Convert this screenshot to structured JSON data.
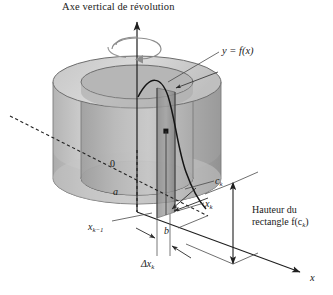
{
  "figure": {
    "domain": "mathematical-diagram",
    "topic": "Méthode des coquilles cylindriques (shell method)",
    "width": 333,
    "height": 295,
    "background": "#ffffff"
  },
  "labels": {
    "title": "Axe vertical de révolution",
    "curve": "y = f(x)",
    "origin": "0",
    "lower_bound": "a",
    "upper_bound": "b",
    "midpoint": "c",
    "midpoint_sub": "k",
    "x_right": "x",
    "x_right_sub": "k",
    "x_left": "x",
    "x_left_sub": "k−1",
    "delta": "Δx",
    "delta_sub": "k",
    "height_line1": "Hauteur du",
    "height_line2": "rectangle",
    "height_value": "f(c",
    "height_value_sub": "k",
    "height_value_end": ")",
    "x_axis": "x"
  },
  "colors": {
    "ink": "#1a1a1a",
    "outline": "#3a3a3a",
    "cylinder_light": "#d8d8d8",
    "cylinder_mid": "#c2c2c2",
    "cylinder_dark": "#a8a8a8",
    "cylinder_darker": "#8f8f8f",
    "shell_face": "#9a9a9a",
    "shell_face_dark": "#7d7d7d",
    "top_annulus": "#cfcfcf",
    "inner_bore": "#bdbdbd",
    "leader": "#555555",
    "background": "#ffffff"
  },
  "geometry": {
    "axis_x": 137,
    "cyl_top_cy": 82,
    "cyl_bottom_cy": 178,
    "cyl_rx": 84,
    "cyl_ry": 26,
    "inner_rx": 56,
    "inner_ry": 17,
    "shell_left": 157,
    "shell_right": 175,
    "height_arrow_x": 233,
    "height_arrow_top": 181,
    "height_arrow_bottom": 266
  },
  "elements": [
    {
      "name": "vertical-axis-arrow",
      "desc": "upward arrow marking the axis of revolution"
    },
    {
      "name": "rotation-arrow",
      "desc": "circular arrow indicating revolution about the vertical axis"
    },
    {
      "name": "outer-cylinder",
      "desc": "large translucent grey cylinder"
    },
    {
      "name": "inner-bore",
      "desc": "hollow cylindrical core"
    },
    {
      "name": "shell-strip",
      "desc": "thin cylindrical shell of thickness delta x sub k"
    },
    {
      "name": "function-curve",
      "desc": "curve y = f(x) descending across the solid"
    },
    {
      "name": "curve-point",
      "desc": "marked point on the curve at x = c sub k"
    },
    {
      "name": "x-axis-arrow",
      "desc": "diagonal x axis toward lower right"
    },
    {
      "name": "dashed-axis",
      "desc": "dashed diagonal depth axis through the origin"
    },
    {
      "name": "height-measure-arrow",
      "desc": "double-headed arrow measuring rectangle height"
    }
  ]
}
